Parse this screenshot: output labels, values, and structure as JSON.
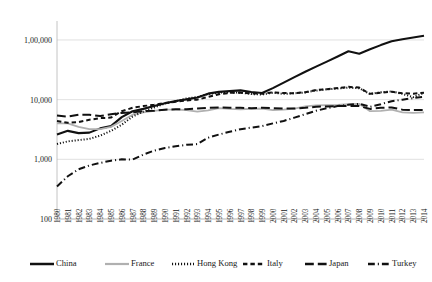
{
  "chart_data": {
    "type": "line",
    "title": "",
    "subtitle": "",
    "xlabel": "",
    "ylabel": "",
    "yscale": "log",
    "ylim": [
      100,
      200000
    ],
    "ytick_labels": [
      "1,00,000",
      "10,000",
      "1,000",
      "100"
    ],
    "ytick_values": [
      100000,
      10000,
      1000,
      100
    ],
    "grid": true,
    "legend_position": "bottom",
    "x": [
      1980,
      1981,
      1982,
      1983,
      1984,
      1985,
      1986,
      1987,
      1988,
      1989,
      1990,
      1991,
      1992,
      1993,
      1994,
      1995,
      1996,
      1997,
      1998,
      1999,
      2000,
      2001,
      2002,
      2003,
      2004,
      2005,
      2006,
      2007,
      2008,
      2009,
      2010,
      2011,
      2012,
      2013,
      2014
    ],
    "xtick_labels": [
      "1980",
      "1981",
      "1982",
      "1983",
      "1984",
      "1985",
      "1986",
      "1987",
      "1988",
      "1989",
      "1990",
      "1991",
      "1992",
      "1993",
      "1994",
      "1995",
      "1996",
      "1997",
      "1998",
      "1999",
      "2000",
      "2001",
      "2002",
      "2003",
      "2004",
      "2005",
      "2006",
      "2007",
      "2008",
      "2009",
      "2010",
      "2011",
      "2012",
      "2013",
      "2014"
    ],
    "series": [
      {
        "name": "China",
        "style": "solid",
        "color": "#111111",
        "width": 2.1,
        "values": [
          2600,
          3000,
          2750,
          2800,
          3300,
          3600,
          5100,
          6400,
          7000,
          7800,
          8700,
          9500,
          10100,
          10900,
          12600,
          13500,
          13900,
          14300,
          13400,
          12900,
          15600,
          19300,
          23900,
          29300,
          35800,
          43400,
          52800,
          64800,
          58900,
          70000,
          82000,
          95000,
          103000,
          110000,
          118000
        ]
      },
      {
        "name": "France",
        "style": "solid",
        "color": "#b0b0b0",
        "width": 1.8,
        "values": [
          4000,
          4000,
          3500,
          3200,
          3200,
          3500,
          4400,
          5600,
          6100,
          6500,
          6800,
          6800,
          6700,
          6300,
          6600,
          7200,
          7000,
          6900,
          7000,
          7100,
          6700,
          6800,
          7100,
          7700,
          8000,
          8100,
          8200,
          8400,
          8500,
          6400,
          6500,
          6800,
          6100,
          6000,
          6100
        ]
      },
      {
        "name": "Hong Kong",
        "style": "dotted",
        "color": "#111111",
        "width": 2.0,
        "values": [
          1800,
          2000,
          2100,
          2200,
          2500,
          3000,
          3800,
          5200,
          6300,
          7400,
          8600,
          9400,
          10500,
          11000,
          12400,
          13100,
          13200,
          13100,
          12400,
          12200,
          13100,
          12500,
          12800,
          13200,
          14200,
          14900,
          15300,
          15900,
          15500,
          12400,
          13300,
          13700,
          12500,
          11000,
          13000
        ]
      },
      {
        "name": "Italy",
        "style": "dashed-short",
        "color": "#111111",
        "width": 2.0,
        "values": [
          4400,
          4100,
          4200,
          4600,
          4900,
          5000,
          6400,
          7300,
          7800,
          8200,
          8800,
          9200,
          9700,
          10000,
          11100,
          12300,
          13000,
          13000,
          12700,
          12600,
          13200,
          12900,
          12800,
          13300,
          14500,
          15000,
          15600,
          16400,
          15900,
          12500,
          13100,
          13600,
          12800,
          12600,
          13100
        ]
      },
      {
        "name": "Japan",
        "style": "dashed-long",
        "color": "#111111",
        "width": 2.0,
        "values": [
          5400,
          5200,
          5600,
          5600,
          5300,
          5700,
          6000,
          6100,
          6400,
          6500,
          6800,
          6900,
          6900,
          7100,
          7300,
          7400,
          7300,
          7300,
          7200,
          7300,
          7200,
          7100,
          7100,
          7300,
          7600,
          7700,
          7800,
          7800,
          7800,
          7000,
          7300,
          7400,
          6800,
          6700,
          6700
        ]
      },
      {
        "name": "Turkey",
        "style": "dash-dot",
        "color": "#111111",
        "width": 2.0,
        "values": [
          350,
          520,
          680,
          790,
          870,
          950,
          1000,
          990,
          1200,
          1400,
          1550,
          1650,
          1750,
          1800,
          2300,
          2600,
          2900,
          3200,
          3400,
          3600,
          4000,
          4400,
          5000,
          5700,
          6500,
          7200,
          7800,
          8200,
          8500,
          7600,
          8400,
          9400,
          10000,
          10600,
          11200
        ]
      }
    ]
  },
  "legend": {
    "items": [
      {
        "label": "China",
        "key": "china"
      },
      {
        "label": "France",
        "key": "france"
      },
      {
        "label": "Hong Kong",
        "key": "hong-kong"
      },
      {
        "label": "Italy",
        "key": "italy"
      },
      {
        "label": "Japan",
        "key": "japan"
      },
      {
        "label": "Turkey",
        "key": "turkey"
      }
    ]
  }
}
